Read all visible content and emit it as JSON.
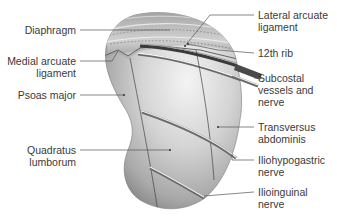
{
  "diagram": {
    "labels_left": [
      {
        "id": "diaphragm",
        "lines": [
          "Diaphragm"
        ]
      },
      {
        "id": "medial-arcuate-ligament",
        "lines": [
          "Medial arcuate",
          "ligament"
        ]
      },
      {
        "id": "psoas-major",
        "lines": [
          "Psoas major"
        ]
      },
      {
        "id": "quadratus-lumborum",
        "lines": [
          "Quadratus",
          "lumborum"
        ]
      }
    ],
    "labels_right": [
      {
        "id": "lateral-arcuate-ligament",
        "lines": [
          "Lateral arcuate",
          "ligament"
        ]
      },
      {
        "id": "12th-rib",
        "lines": [
          "12th rib"
        ]
      },
      {
        "id": "subcostal-vessels-and-nerve",
        "lines": [
          "Subcostal",
          "vessels and",
          "nerve"
        ]
      },
      {
        "id": "transversus-abdominis",
        "lines": [
          "Transversus",
          "abdominis"
        ]
      },
      {
        "id": "iliohypogastric-nerve",
        "lines": [
          "Iliohypogastric",
          "nerve"
        ]
      },
      {
        "id": "ilioinguinal-nerve",
        "lines": [
          "Ilioinguinal",
          "nerve"
        ]
      }
    ],
    "colors": {
      "text": "#3a3a3a",
      "leader": "#555555",
      "background": "#ffffff"
    }
  }
}
